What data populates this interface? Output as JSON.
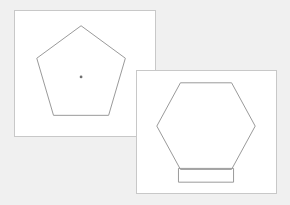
{
  "canvas": {
    "width": 290,
    "height": 205,
    "background_color": "#f0f0f0",
    "panel_fill_color": "#ffffff",
    "panel_border_color": "#c8c8c8",
    "shape_stroke_color": "#9a9a9a",
    "center_dot_color": "#707070"
  },
  "panels": [
    {
      "id": "pentagon-panel",
      "name": "pentagon-panel",
      "x": 14,
      "y": 10,
      "width": 142,
      "height": 127,
      "z_order": 1,
      "shapes": [
        {
          "id": "pentagon",
          "name": "pentagon",
          "type": "polygon",
          "sides": 5,
          "points": "67,15 112,48 95,106 39,106 22,48",
          "center": {
            "x": 67,
            "y": 67
          },
          "has_center_marker": true
        }
      ]
    },
    {
      "id": "hexagon-panel",
      "name": "hexagon-panel",
      "x": 136,
      "y": 70,
      "width": 141,
      "height": 124,
      "z_order": 2,
      "shapes": [
        {
          "id": "hexagon",
          "name": "hexagon",
          "type": "polygon",
          "sides": 6,
          "points": "44,12 96,12 120,56 96,100 44,100 20,56",
          "center": {
            "x": 70,
            "y": 56
          },
          "has_center_marker": false
        },
        {
          "id": "rectangle",
          "name": "rectangle",
          "type": "rect",
          "x": 42,
          "y": 99,
          "width": 56,
          "height": 14
        }
      ]
    }
  ]
}
